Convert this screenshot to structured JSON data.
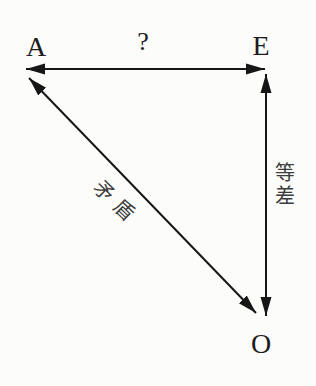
{
  "nodes": [
    {
      "id": "A",
      "label": "A"
    },
    {
      "id": "E",
      "label": "E"
    },
    {
      "id": "O",
      "label": "O"
    }
  ],
  "edges": [
    {
      "from": "A",
      "to": "E",
      "label": "?",
      "arrows": "both",
      "orientation": "horizontal"
    },
    {
      "from": "E",
      "to": "O",
      "label": "等差",
      "arrows": "both",
      "orientation": "vertical"
    },
    {
      "from": "A",
      "to": "O",
      "label": "矛盾",
      "arrows": "both",
      "orientation": "diagonal"
    }
  ],
  "colors": {
    "background": "#fcfcfb",
    "line": "#161616",
    "latin_text": "#1c1c1c",
    "cjk_text": "#3c3c3c"
  }
}
